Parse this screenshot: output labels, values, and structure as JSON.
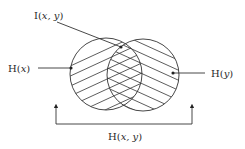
{
  "diagram": {
    "type": "venn-entropy",
    "labels": {
      "mutual_information": {
        "prefix": "I(",
        "args": "x, y",
        "suffix": ")"
      },
      "entropy_x": {
        "prefix": "H(",
        "args": "x",
        "suffix": ")"
      },
      "entropy_y": {
        "prefix": "H(",
        "args": "y",
        "suffix": ")"
      },
      "joint_entropy": {
        "prefix": "H(",
        "args": "x, y",
        "suffix": ")"
      }
    },
    "circles": [
      {
        "name": "H(x)",
        "cx": 106,
        "cy": 74,
        "r": 36,
        "hatch": "ascending"
      },
      {
        "name": "H(y)",
        "cx": 143,
        "cy": 75,
        "r": 36,
        "hatch": "descending"
      }
    ],
    "colors": {
      "line": "#333333",
      "text": "#2a2a2a",
      "background": "#ffffff"
    }
  }
}
